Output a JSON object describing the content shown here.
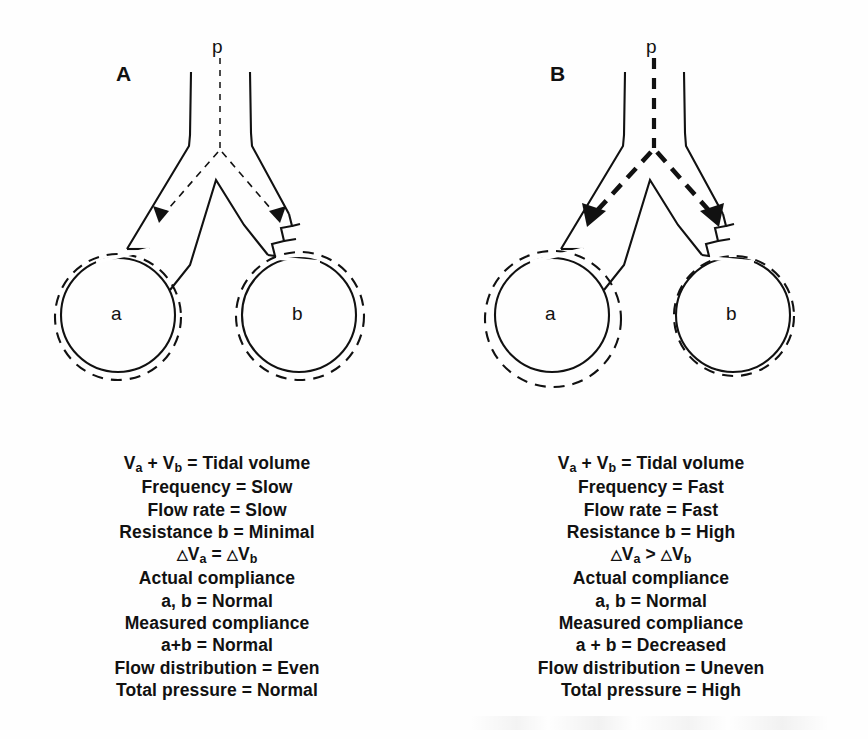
{
  "figure": {
    "panels": [
      {
        "letter": "A",
        "pressure_label": "p",
        "balloon_left_label": "a",
        "balloon_right_label": "b",
        "arrow_style": "thin-dashed",
        "specs": [
          {
            "id": "tidal-volume",
            "html": "V<sub>a</sub> + V<sub>b</sub> = Tidal volume",
            "text": "Va + Vb = Tidal volume",
            "align": "center"
          },
          {
            "id": "frequency",
            "html": "Frequency = Slow",
            "text": "Frequency = Slow",
            "align": "center"
          },
          {
            "id": "flow-rate",
            "html": "Flow rate = Slow",
            "text": "Flow rate = Slow",
            "align": "center"
          },
          {
            "id": "resistance-b",
            "html": "Resistance b = Minimal",
            "text": "Resistance b = Minimal",
            "align": "center"
          },
          {
            "id": "delta-volumes",
            "html": "<span class='tri'>&#9651;</span>V<sub>a</sub> = <span class='tri'>&#9651;</span>V<sub>b</sub>",
            "text": "△Va = △Vb",
            "align": "center"
          },
          {
            "id": "actual-compliance-header",
            "html": "Actual compliance",
            "text": "Actual compliance",
            "align": "center"
          },
          {
            "id": "actual-compliance-value",
            "html": "a, b = Normal",
            "text": "a, b = Normal",
            "align": "center"
          },
          {
            "id": "measured-compliance-header",
            "html": "Measured compliance",
            "text": "Measured compliance",
            "align": "center"
          },
          {
            "id": "measured-compliance-value",
            "html": "a+b = Normal",
            "text": "a+b = Normal",
            "align": "center"
          },
          {
            "id": "flow-distribution",
            "html": "Flow distribution = Even",
            "text": "Flow distribution = Even",
            "align": "center"
          },
          {
            "id": "total-pressure",
            "html": "Total pressure = Normal",
            "text": "Total pressure = Normal",
            "align": "center"
          }
        ]
      },
      {
        "letter": "B",
        "pressure_label": "p",
        "balloon_left_label": "a",
        "balloon_right_label": "b",
        "arrow_style": "thick-dashed",
        "specs": [
          {
            "id": "tidal-volume",
            "html": "V<sub>a</sub> + V<sub>b</sub> = Tidal volume",
            "text": "Va + Vb = Tidal volume",
            "align": "center"
          },
          {
            "id": "frequency",
            "html": "Frequency = Fast",
            "text": "Frequency = Fast",
            "align": "center"
          },
          {
            "id": "flow-rate",
            "html": "Flow rate = Fast",
            "text": "Flow rate = Fast",
            "align": "center"
          },
          {
            "id": "resistance-b",
            "html": "Resistance b = High",
            "text": "Resistance b = High",
            "align": "center"
          },
          {
            "id": "delta-volumes",
            "html": "<span class='tri'>&#9651;</span>V<sub>a</sub> &gt; <span class='tri'>&#9651;</span>V<sub>b</sub>",
            "text": "△Va > △Vb",
            "align": "center"
          },
          {
            "id": "actual-compliance-header",
            "html": "Actual compliance",
            "text": "Actual compliance",
            "align": "center"
          },
          {
            "id": "actual-compliance-value",
            "html": "a, b = Normal",
            "text": "a, b = Normal",
            "align": "center"
          },
          {
            "id": "measured-compliance-header",
            "html": "Measured compliance",
            "text": "Measured compliance",
            "align": "center"
          },
          {
            "id": "measured-compliance-value",
            "html": "a + b = Decreased",
            "text": "a + b = Decreased",
            "align": "center"
          },
          {
            "id": "flow-distribution",
            "html": "Flow distribution = Uneven",
            "text": "Flow distribution = Uneven",
            "align": "center"
          },
          {
            "id": "total-pressure",
            "html": "Total pressure = High",
            "text": "Total pressure = High",
            "align": "center"
          }
        ]
      }
    ],
    "colors": {
      "ink": "#111111",
      "background": "#ffffff"
    }
  }
}
